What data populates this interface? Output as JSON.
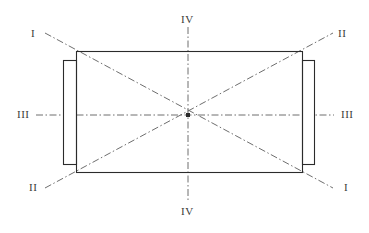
{
  "diagram": {
    "type": "engineering-section-axes",
    "canvas": {
      "width": 369,
      "height": 233,
      "background": "#ffffff"
    },
    "colors": {
      "outline": "#2b2b2b",
      "axis": "#6e6e6e",
      "label": "#3a3a3a",
      "background": "#ffffff"
    },
    "body": {
      "name": "main-rectangle",
      "x": 76,
      "y": 51,
      "width": 226,
      "height": 121,
      "stroke_width": 1.1
    },
    "flanges": [
      {
        "name": "left-flange",
        "x": 63,
        "y": 60,
        "width": 13,
        "height": 104,
        "stroke_width": 1.1
      },
      {
        "name": "right-flange",
        "x": 302,
        "y": 60,
        "width": 12,
        "height": 104,
        "stroke_width": 1.1
      }
    ],
    "center": {
      "x": 188,
      "y": 115
    },
    "axes": [
      {
        "name": "axis-I",
        "kind": "diagonal",
        "x1": 45,
        "y1": 33,
        "x2": 333,
        "y2": 188
      },
      {
        "name": "axis-II",
        "kind": "diagonal",
        "x1": 45,
        "y1": 188,
        "x2": 333,
        "y2": 33
      },
      {
        "name": "axis-III",
        "kind": "horizontal",
        "x1": 36,
        "y1": 115,
        "x2": 334,
        "y2": 115
      },
      {
        "name": "axis-IV",
        "kind": "vertical",
        "x1": 188,
        "y1": 27,
        "x2": 188,
        "y2": 202
      }
    ],
    "dash_pattern": "7 2.5 1.5 2.5",
    "labels": [
      {
        "name": "label-I-top-left",
        "text": "I",
        "x": 31,
        "y": 28
      },
      {
        "name": "label-II-top-right",
        "text": "II",
        "x": 338,
        "y": 28
      },
      {
        "name": "label-IV-top",
        "text": "IV",
        "x": 181,
        "y": 14
      },
      {
        "name": "label-III-left",
        "text": "III",
        "x": 17,
        "y": 109
      },
      {
        "name": "label-III-right",
        "text": "III",
        "x": 341,
        "y": 109
      },
      {
        "name": "label-II-bottom-left",
        "text": "II",
        "x": 29,
        "y": 182
      },
      {
        "name": "label-I-bottom-right",
        "text": "I",
        "x": 344,
        "y": 182
      },
      {
        "name": "label-IV-bottom",
        "text": "IV",
        "x": 181,
        "y": 206
      }
    ]
  }
}
